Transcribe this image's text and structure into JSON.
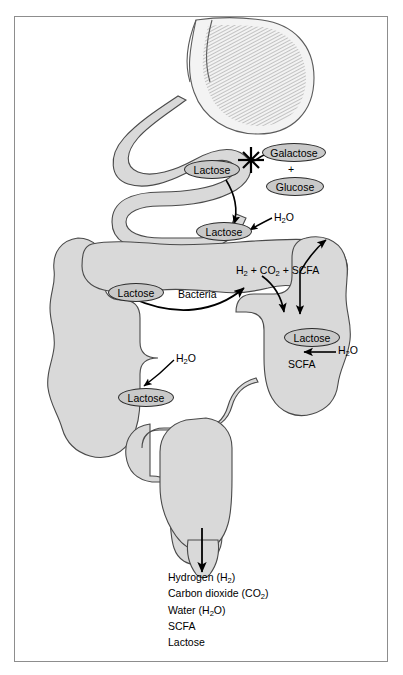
{
  "figure": {
    "frame_color": "#8d8d8d",
    "organ_fill": "#d9d9d9",
    "organ_stroke": "#4a4a4a",
    "label_fill": "#c9c9c9",
    "label_stroke": "#2b2b2b"
  },
  "labels": {
    "lactose_duodenum": "Lactose",
    "lactose_jejunum": "Lactose",
    "lactose_colon_left": "Lactose",
    "lactose_descending": "Lactose",
    "lactose_ileum": "Lactose",
    "galactose": "Galactose",
    "plus": "+",
    "glucose": "Glucose",
    "water_small_intestine": "H₂O",
    "water_colon_right": "H₂O",
    "water_descending": "H₂O",
    "bacteria": "Bacteria",
    "gases": "H₂ + CO₂ + SCFA",
    "scfa": "SCFA"
  },
  "output_list": {
    "items": [
      "Hydrogen (H₂)",
      "Carbon dioxide (CO₂)",
      "Water (H₂O)",
      "SCFA",
      "Lactose"
    ]
  },
  "icons": {
    "blocked_reaction": "x-block-icon",
    "arrow": "arrow-icon"
  }
}
